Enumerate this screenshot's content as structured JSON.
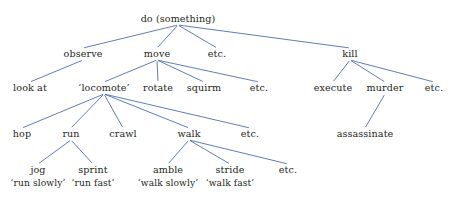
{
  "diagram": {
    "title": "do (something)",
    "style": {
      "background_color": "#ffffff",
      "edge_color": "#4f6fad",
      "text_color": "#231f20"
    },
    "nodes": [
      {
        "id": "root",
        "label": "do (something)",
        "x": 178,
        "y": 19,
        "level": 0
      },
      {
        "id": "observe",
        "label": "observe",
        "x": 83,
        "y": 54,
        "level": 1
      },
      {
        "id": "move",
        "label": "move",
        "x": 157,
        "y": 54,
        "level": 1
      },
      {
        "id": "etc_l1",
        "label": "etc.",
        "x": 217,
        "y": 54,
        "level": 1
      },
      {
        "id": "kill",
        "label": "kill",
        "x": 350,
        "y": 54,
        "level": 1
      },
      {
        "id": "look_at",
        "label": "look at",
        "x": 30,
        "y": 88,
        "level": 2
      },
      {
        "id": "locomote",
        "label": "‘locomote’",
        "x": 104,
        "y": 88,
        "level": 2
      },
      {
        "id": "rotate",
        "label": "rotate",
        "x": 158,
        "y": 88,
        "level": 2
      },
      {
        "id": "squirm",
        "label": "squirm",
        "x": 204,
        "y": 88,
        "level": 2
      },
      {
        "id": "etc_move",
        "label": "etc.",
        "x": 259,
        "y": 88,
        "level": 2
      },
      {
        "id": "execute",
        "label": "execute",
        "x": 333,
        "y": 88,
        "level": 2
      },
      {
        "id": "murder",
        "label": "murder",
        "x": 385,
        "y": 88,
        "level": 2
      },
      {
        "id": "etc_kill",
        "label": "etc.",
        "x": 434,
        "y": 88,
        "level": 2
      },
      {
        "id": "hop",
        "label": "hop",
        "x": 22,
        "y": 134,
        "level": 3
      },
      {
        "id": "run",
        "label": "run",
        "x": 71,
        "y": 134,
        "level": 3
      },
      {
        "id": "crawl",
        "label": "crawl",
        "x": 123,
        "y": 134,
        "level": 3
      },
      {
        "id": "walk",
        "label": "walk",
        "x": 189,
        "y": 134,
        "level": 3
      },
      {
        "id": "etc_loco",
        "label": "etc.",
        "x": 250,
        "y": 134,
        "level": 3
      },
      {
        "id": "assassinate",
        "label": "assassinate",
        "x": 365,
        "y": 134,
        "level": 3
      },
      {
        "id": "jog",
        "label": "jog",
        "x": 38,
        "y": 170,
        "level": 4
      },
      {
        "id": "sprint",
        "label": "sprint",
        "x": 93,
        "y": 170,
        "level": 4
      },
      {
        "id": "amble",
        "label": "amble",
        "x": 168,
        "y": 170,
        "level": 4
      },
      {
        "id": "stride",
        "label": "stride",
        "x": 230,
        "y": 170,
        "level": 4
      },
      {
        "id": "etc_walk",
        "label": "etc.",
        "x": 288,
        "y": 170,
        "level": 4
      }
    ],
    "glosses": [
      {
        "id": "gloss_jog",
        "for": "jog",
        "label": "‘run slowly’",
        "x": 38,
        "y": 184
      },
      {
        "id": "gloss_sprint",
        "for": "sprint",
        "label": "‘run fast’",
        "x": 93,
        "y": 184
      },
      {
        "id": "gloss_amble",
        "for": "amble",
        "label": "‘walk slowly’",
        "x": 168,
        "y": 184
      },
      {
        "id": "gloss_stride",
        "for": "stride",
        "label": "‘walk fast’",
        "x": 230,
        "y": 184
      }
    ],
    "edges": [
      {
        "from": "root",
        "to": "observe"
      },
      {
        "from": "root",
        "to": "move"
      },
      {
        "from": "root",
        "to": "etc_l1"
      },
      {
        "from": "root",
        "to": "kill"
      },
      {
        "from": "observe",
        "to": "look_at"
      },
      {
        "from": "move",
        "to": "locomote"
      },
      {
        "from": "move",
        "to": "rotate"
      },
      {
        "from": "move",
        "to": "squirm"
      },
      {
        "from": "move",
        "to": "etc_move"
      },
      {
        "from": "kill",
        "to": "execute"
      },
      {
        "from": "kill",
        "to": "murder"
      },
      {
        "from": "kill",
        "to": "etc_kill"
      },
      {
        "from": "locomote",
        "to": "hop"
      },
      {
        "from": "locomote",
        "to": "run"
      },
      {
        "from": "locomote",
        "to": "crawl"
      },
      {
        "from": "locomote",
        "to": "walk"
      },
      {
        "from": "locomote",
        "to": "etc_loco"
      },
      {
        "from": "murder",
        "to": "assassinate"
      },
      {
        "from": "run",
        "to": "jog"
      },
      {
        "from": "run",
        "to": "sprint"
      },
      {
        "from": "walk",
        "to": "amble"
      },
      {
        "from": "walk",
        "to": "stride"
      },
      {
        "from": "walk",
        "to": "etc_walk"
      }
    ]
  }
}
